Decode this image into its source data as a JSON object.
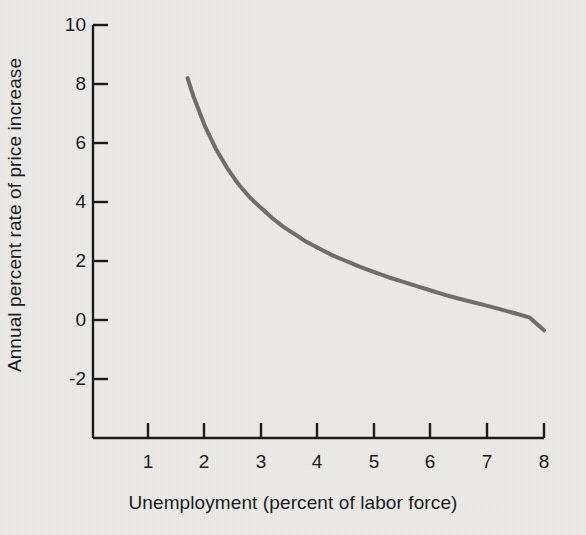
{
  "chart_data": {
    "type": "line",
    "title": "",
    "subtitle": "",
    "xlabel": "Unemployment (percent of labor force)",
    "ylabel": "Annual percent rate of price increase",
    "xlim": [
      0.6,
      8.0
    ],
    "ylim": [
      -3.2,
      10.0
    ],
    "xticks": [
      1,
      2,
      3,
      4,
      5,
      6,
      7,
      8
    ],
    "xtick_labels": [
      "1",
      "2",
      "3",
      "4",
      "5",
      "6",
      "7",
      "8"
    ],
    "yticks": [
      -2,
      0,
      2,
      4,
      6,
      8,
      10
    ],
    "ytick_labels": [
      "-2",
      "0",
      "2",
      "4",
      "6",
      "8",
      "10"
    ],
    "grid": false,
    "legend": false,
    "legend_position": "none",
    "series": [
      {
        "name": "Phillips curve",
        "color": "#6e6e6e",
        "linewidth": 4,
        "x": [
          1.7,
          1.8,
          1.9,
          2.0,
          2.2,
          2.4,
          2.6,
          2.8,
          3.0,
          3.2,
          3.4,
          3.6,
          3.8,
          4.0,
          4.25,
          4.5,
          4.75,
          5.0,
          5.25,
          5.5,
          5.75,
          6.0,
          6.25,
          6.5,
          6.75,
          7.0,
          7.25,
          7.5,
          7.75,
          8.0
        ],
        "y": [
          8.2,
          7.6,
          7.1,
          6.6,
          5.8,
          5.15,
          4.6,
          4.15,
          3.8,
          3.45,
          3.15,
          2.9,
          2.65,
          2.45,
          2.2,
          2.0,
          1.8,
          1.62,
          1.45,
          1.3,
          1.15,
          1.0,
          0.85,
          0.72,
          0.6,
          0.48,
          0.35,
          0.22,
          0.08,
          -0.35
        ]
      }
    ]
  },
  "axis": {
    "x_title": "Unemployment (percent of labor force)",
    "y_title": "Annual percent rate of price increase"
  },
  "colors": {
    "curve": "#6e6e6e",
    "axis": "#1b1b1b",
    "background": "#ecebe8",
    "text": "#1b1b1b"
  }
}
